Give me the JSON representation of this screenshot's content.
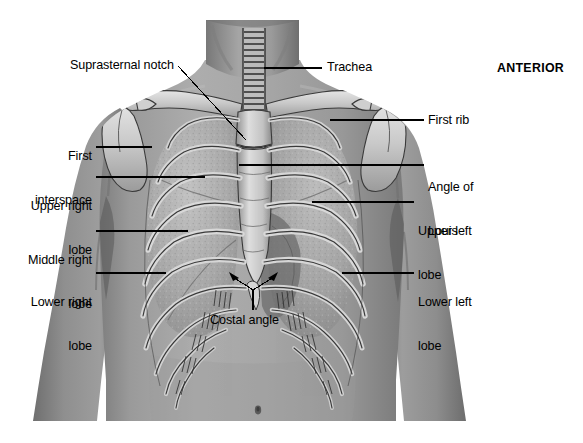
{
  "figure": {
    "title_text": "ANTERIOR",
    "orientation_label": "ANTERIOR",
    "colors": {
      "background": "#ffffff",
      "skin_light": "#b4b4b4",
      "skin_mid": "#949494",
      "skin_shadow": "#6e6e6e",
      "skin_dark": "#555555",
      "bone_light": "#dcdcdc",
      "bone_mid": "#b8b8b8",
      "bone_outline": "#3a3a3a",
      "lung_tissue": "#a9a9a9",
      "lung_dark": "#777777",
      "leader_line": "#000000",
      "text": "#000000"
    }
  },
  "labels": [
    {
      "id": "suprasternal-notch",
      "text": "Suprasternal notch",
      "lines": [
        "Suprasternal notch"
      ],
      "side": "left",
      "x": 70,
      "y": 58,
      "align": "left"
    },
    {
      "id": "trachea",
      "text": "Trachea",
      "lines": [
        "Trachea"
      ],
      "side": "right",
      "x": 327,
      "y": 60,
      "align": "left"
    },
    {
      "id": "anterior",
      "text": "ANTERIOR",
      "lines": [
        "ANTERIOR"
      ],
      "side": "right",
      "x": 497,
      "y": 61,
      "align": "left"
    },
    {
      "id": "first-rib",
      "text": "First rib",
      "lines": [
        "First rib"
      ],
      "side": "right",
      "x": 428,
      "y": 117,
      "align": "left"
    },
    {
      "id": "first-interspace",
      "text": "First interspace",
      "lines": [
        "First",
        "interspace"
      ],
      "side": "left",
      "x": 16,
      "y": 123,
      "align": "right",
      "width": 76
    },
    {
      "id": "angle-of-louis",
      "text": "Angle of Louis",
      "lines": [
        "Angle of",
        "Louis"
      ],
      "side": "right",
      "x": 428,
      "y": 155,
      "align": "left"
    },
    {
      "id": "upper-right-lobe",
      "text": "Upper right lobe",
      "lines": [
        "Upper right",
        "lobe"
      ],
      "side": "left",
      "x": 10,
      "y": 168,
      "align": "right",
      "width": 82
    },
    {
      "id": "upper-left-lobe",
      "text": "Upper left lobe",
      "lines": [
        "Upper left",
        "lobe"
      ],
      "side": "right",
      "x": 418,
      "y": 195,
      "align": "left"
    },
    {
      "id": "middle-right-lobe",
      "text": "Middle right lobe",
      "lines": [
        "Middle right",
        "lobe"
      ],
      "side": "left",
      "x": 6,
      "y": 220,
      "align": "right",
      "width": 86
    },
    {
      "id": "lower-right-lobe",
      "text": "Lower right lobe",
      "lines": [
        "Lower right",
        "lobe"
      ],
      "side": "left",
      "x": 8,
      "y": 262,
      "align": "right",
      "width": 84
    },
    {
      "id": "lower-left-lobe",
      "text": "Lower left lobe",
      "lines": [
        "Lower left",
        "lobe"
      ],
      "side": "right",
      "x": 418,
      "y": 266,
      "align": "left"
    },
    {
      "id": "costal-angle",
      "text": "Costal angle",
      "lines": [
        "Costal angle"
      ],
      "side": "center",
      "x": 210,
      "y": 313,
      "align": "left"
    }
  ],
  "anatomy_parts": [
    "neck",
    "left-clavicle",
    "right-clavicle",
    "scapula",
    "sternum",
    "manubrium",
    "xiphoid-process",
    "ribs",
    "costal-cartilage",
    "trachea",
    "right-lung",
    "left-lung",
    "umbilicus",
    "arms"
  ]
}
